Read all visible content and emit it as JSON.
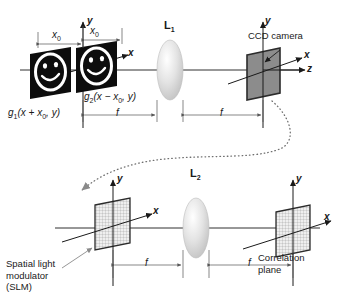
{
  "figure": {
    "type": "optical-system-diagram",
    "rows": [
      {
        "name": "input-stage",
        "elements": [
          "input-transparencies",
          "lens-L1",
          "ccd-camera"
        ]
      },
      {
        "name": "correlation-stage",
        "elements": [
          "spatial-light-modulator",
          "lens-L2",
          "correlation-plane"
        ]
      }
    ]
  },
  "top": {
    "object1": {
      "label_fn": "g",
      "label_sub": "1",
      "label_arg": "(x + x",
      "label_arg_sub": "0",
      "label_arg_end": ", y)",
      "kind": "smiley-transparency"
    },
    "object2": {
      "label_fn": "g",
      "label_sub": "2",
      "label_arg": "(x − x",
      "label_arg_sub": "0",
      "label_arg_end": ", y)",
      "kind": "smiley-transparency"
    },
    "offset_left": {
      "text": "x",
      "sub": "0"
    },
    "offset_right": {
      "text": "x",
      "sub": "0"
    },
    "lens": {
      "label": "L",
      "sub": "1"
    },
    "focal_left": "f",
    "focal_right": "f",
    "detector": {
      "label": "CCD camera"
    },
    "axes": {
      "y": "y",
      "x_input": "x",
      "x_detector": "x",
      "z_detector": "z",
      "y_detector": "y"
    }
  },
  "bottom": {
    "modulator": {
      "line1": "Spatial light",
      "line2": "modulator",
      "line3": "(SLM)"
    },
    "lens": {
      "label": "L",
      "sub": "2"
    },
    "focal_left": "f",
    "focal_right": "f",
    "output": {
      "line1": "Correlation",
      "line2": "plane"
    },
    "axes": {
      "y_slm": "y",
      "x_slm": "x",
      "y_out": "y",
      "x_out": "x"
    }
  },
  "colors": {
    "background": "#ffffff",
    "line": "#1a1a1a",
    "dim_line": "#555555",
    "lens_fill": "#d9d9d9",
    "ccd_fill": "#8c8c8c",
    "ccd_edge": "#2b2b2b",
    "transparency_fill": "#0d0d0d",
    "transparency_face": "#ffffff",
    "grid_fill": "#eeeeee",
    "grid_line": "#8a8a8a",
    "dotted_path": "#707070"
  }
}
